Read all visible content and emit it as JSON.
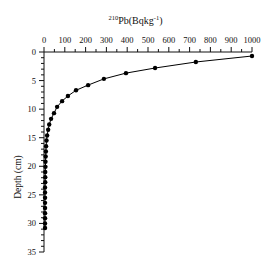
{
  "chart_data": {
    "type": "line",
    "title": "",
    "xlabel": "210Pb(Bqkg-1)",
    "xlabel_parts": {
      "sup": "210",
      "main": "Pb(Bqkg",
      "sup2": "-1",
      "end": ")"
    },
    "ylabel": "Depth (cm)",
    "x_axis_position": "top",
    "y_inverted": true,
    "xlim": [
      0,
      1000
    ],
    "ylim": [
      0,
      35
    ],
    "xticks": [
      0,
      100,
      200,
      300,
      400,
      500,
      600,
      700,
      800,
      900,
      1000
    ],
    "yticks": [
      0,
      5,
      10,
      15,
      20,
      25,
      30,
      35
    ],
    "grid": false,
    "legend": null,
    "series": [
      {
        "name": "210Pb activity",
        "marker": "circle",
        "color": "#000000",
        "points": [
          {
            "activity": 1000,
            "depth": 0.7
          },
          {
            "activity": 730,
            "depth": 1.75
          },
          {
            "activity": 534,
            "depth": 2.8
          },
          {
            "activity": 394,
            "depth": 3.7
          },
          {
            "activity": 288,
            "depth": 4.7
          },
          {
            "activity": 212,
            "depth": 5.8
          },
          {
            "activity": 154,
            "depth": 6.7
          },
          {
            "activity": 115,
            "depth": 7.7
          },
          {
            "activity": 87,
            "depth": 8.6
          },
          {
            "activity": 63,
            "depth": 9.6
          },
          {
            "activity": 48,
            "depth": 10.7
          },
          {
            "activity": 34,
            "depth": 11.7
          },
          {
            "activity": 25,
            "depth": 12.7
          },
          {
            "activity": 20,
            "depth": 13.6
          },
          {
            "activity": 15,
            "depth": 14.6
          },
          {
            "activity": 12,
            "depth": 15.5
          },
          {
            "activity": 10,
            "depth": 16.5
          },
          {
            "activity": 9,
            "depth": 17.4
          },
          {
            "activity": 8,
            "depth": 18.3
          },
          {
            "activity": 7,
            "depth": 19.2
          },
          {
            "activity": 7,
            "depth": 20.1
          },
          {
            "activity": 6,
            "depth": 21.0
          },
          {
            "activity": 6,
            "depth": 21.9
          },
          {
            "activity": 6,
            "depth": 22.8
          },
          {
            "activity": 5,
            "depth": 23.7
          },
          {
            "activity": 5,
            "depth": 24.6
          },
          {
            "activity": 5,
            "depth": 25.5
          },
          {
            "activity": 5,
            "depth": 26.4
          },
          {
            "activity": 5,
            "depth": 27.3
          },
          {
            "activity": 5,
            "depth": 28.2
          },
          {
            "activity": 5,
            "depth": 29.1
          },
          {
            "activity": 5,
            "depth": 30.0
          },
          {
            "activity": 5,
            "depth": 30.8
          }
        ]
      }
    ]
  }
}
